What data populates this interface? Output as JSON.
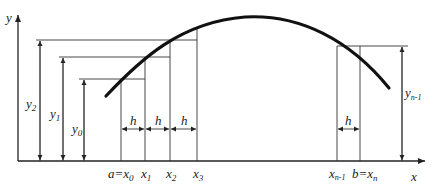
{
  "diagram": {
    "axes": {
      "x_label": "x",
      "y_label": "y"
    },
    "nodes_labels": {
      "x0": "a=x",
      "x0_sub": "0",
      "x1": "x",
      "x1_sub": "1",
      "x2": "x",
      "x2_sub": "2",
      "x3": "x",
      "x3_sub": "3",
      "xn1": "x",
      "xn1_sub": "n-1",
      "xn": "b=x",
      "xn_sub": "n"
    },
    "ordinate_labels": {
      "y0": "y",
      "y0_sub": "0",
      "y1": "y",
      "y1_sub": "1",
      "y2": "y",
      "y2_sub": "2",
      "yn1": "y",
      "yn1_sub": "n-1"
    },
    "step_label": "h",
    "colors": {
      "line": "#333333",
      "curve": "#111111",
      "background": "#ffffff"
    }
  }
}
